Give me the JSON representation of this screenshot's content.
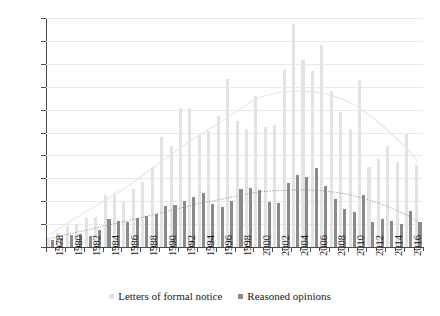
{
  "chart_data": {
    "type": "bar",
    "title": "",
    "subtitle": "",
    "xlabel": "",
    "ylabel": "",
    "ylim": [
      0,
      2000
    ],
    "ytick_step": 200,
    "ytick_labels": [
      "0",
      "200",
      "400",
      "600",
      "800",
      "1,000",
      "1,200",
      "1,400",
      "1,600",
      "1,800",
      "2,000"
    ],
    "grid": true,
    "legend_position": "bottom-center",
    "categories": [
      "1978",
      "1979",
      "1980",
      "1981",
      "1982",
      "1983",
      "1984",
      "1985",
      "1986",
      "1987",
      "1988",
      "1989",
      "1990",
      "1991",
      "1992",
      "1993",
      "1994",
      "1995",
      "1996",
      "1997",
      "1998",
      "1999",
      "2000",
      "2001",
      "2002",
      "2003",
      "2004",
      "2005",
      "2006",
      "2007",
      "2008",
      "2009",
      "2010",
      "2011",
      "2012",
      "2013",
      "2014",
      "2015",
      "2016",
      "2017"
    ],
    "xtick_labels": [
      "1978",
      "1980",
      "1982",
      "1984",
      "1986",
      "1988",
      "1990",
      "1992",
      "1994",
      "1996",
      "1998",
      "2000",
      "2002",
      "2004",
      "2006",
      "2008",
      "2010",
      "2012",
      "2014",
      "2016"
    ],
    "series": [
      {
        "name": "Letters of formal notice",
        "color": "#e3e3e3",
        "values": [
          75,
          120,
          185,
          205,
          250,
          265,
          450,
          475,
          405,
          510,
          570,
          700,
          960,
          885,
          1215,
          1215,
          980,
          1010,
          1145,
          1465,
          1100,
          1035,
          1315,
          1050,
          1070,
          1545,
          1950,
          1630,
          1540,
          1765,
          1360,
          1180,
          1035,
          1455,
          700,
          765,
          885,
          740,
          990,
          715
        ]
      },
      {
        "name": "Reasoned opinions",
        "color": "#8a8a8a",
        "values": [
          65,
          80,
          105,
          115,
          95,
          150,
          245,
          230,
          215,
          250,
          270,
          290,
          360,
          365,
          405,
          435,
          475,
          380,
          350,
          405,
          505,
          515,
          495,
          390,
          385,
          560,
          625,
          610,
          690,
          535,
          420,
          335,
          305,
          455,
          215,
          245,
          225,
          205,
          315,
          215
        ]
      }
    ],
    "trendlines": [
      {
        "for_series": "Letters of formal notice",
        "style": "solid",
        "color": "#e6e6e6",
        "points": [
          [
            0,
            110
          ],
          [
            2,
            220
          ],
          [
            4,
            320
          ],
          [
            6,
            420
          ],
          [
            8,
            520
          ],
          [
            10,
            640
          ],
          [
            12,
            760
          ],
          [
            14,
            880
          ],
          [
            16,
            990
          ],
          [
            18,
            1090
          ],
          [
            20,
            1200
          ],
          [
            22,
            1300
          ],
          [
            24,
            1345
          ],
          [
            26,
            1360
          ],
          [
            28,
            1355
          ],
          [
            30,
            1320
          ],
          [
            32,
            1250
          ],
          [
            34,
            1140
          ],
          [
            36,
            1000
          ],
          [
            38,
            840
          ],
          [
            39,
            740
          ]
        ]
      },
      {
        "for_series": "Reasoned opinions",
        "style": "dotted",
        "color": "#8a8a8a",
        "points": [
          [
            0,
            75
          ],
          [
            2,
            115
          ],
          [
            4,
            150
          ],
          [
            6,
            190
          ],
          [
            8,
            225
          ],
          [
            10,
            265
          ],
          [
            12,
            305
          ],
          [
            14,
            345
          ],
          [
            16,
            385
          ],
          [
            18,
            415
          ],
          [
            20,
            450
          ],
          [
            22,
            480
          ],
          [
            24,
            492
          ],
          [
            26,
            498
          ],
          [
            28,
            495
          ],
          [
            30,
            480
          ],
          [
            32,
            450
          ],
          [
            34,
            405
          ],
          [
            36,
            345
          ],
          [
            38,
            270
          ],
          [
            39,
            215
          ]
        ]
      }
    ]
  },
  "legend": {
    "items": [
      {
        "label": "Letters of formal notice",
        "color": "#e3e3e3"
      },
      {
        "label": "Reasoned opinions",
        "color": "#8a8a8a"
      }
    ]
  },
  "axes": {
    "y_axis_name": "value-axis",
    "x_axis_name": "year-axis"
  }
}
